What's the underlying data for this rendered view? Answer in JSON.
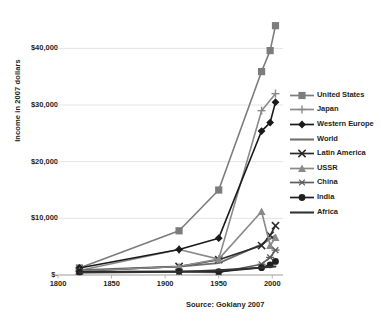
{
  "chart_data": {
    "type": "line",
    "title": "",
    "xlabel": "",
    "ylabel": "Income in 2007 dollars",
    "xlim": [
      1800,
      2010
    ],
    "ylim": [
      0,
      45000
    ],
    "grid": true,
    "legend_position": "right",
    "x_ticks": [
      "1800",
      "1850",
      "1900",
      "1950",
      "2000"
    ],
    "x_tick_values": [
      1800,
      1850,
      1900,
      1950,
      2000
    ],
    "y_ticks": [
      "$-",
      "$10,000",
      "$20,000",
      "$30,000",
      "$40,000"
    ],
    "y_tick_values": [
      0,
      10000,
      20000,
      30000,
      40000
    ],
    "source": "Source: Goklany 2007",
    "series": [
      {
        "name": "United States",
        "color": "#7c7c7c",
        "marker": "square",
        "x": [
          1820,
          1913,
          1950,
          1990,
          1998,
          2003
        ],
        "values": [
          1250,
          7800,
          15000,
          35900,
          39600,
          44000
        ]
      },
      {
        "name": "Japan",
        "color": "#8a8a8a",
        "marker": "plus",
        "x": [
          1820,
          1913,
          1950,
          1990,
          2003
        ],
        "values": [
          800,
          4500,
          2800,
          29000,
          32000
        ]
      },
      {
        "name": "Western Europe",
        "color": "#1a1a1a",
        "marker": "diamond",
        "x": [
          1820,
          1913,
          1950,
          1990,
          1998,
          2003
        ],
        "values": [
          1250,
          4500,
          6500,
          25400,
          26900,
          30500
        ]
      },
      {
        "name": "World",
        "color": "#6f6f6f",
        "marker": "none",
        "x": [
          1820,
          1913,
          1950,
          1990,
          2003
        ],
        "values": [
          850,
          1500,
          2100,
          5400,
          7000
        ]
      },
      {
        "name": "Latin America",
        "color": "#2a2a2a",
        "marker": "cross",
        "x": [
          1820,
          1913,
          1950,
          1990,
          1998,
          2003
        ],
        "values": [
          700,
          1500,
          2700,
          5200,
          7000,
          8700
        ]
      },
      {
        "name": "USSR",
        "color": "#8a8a8a",
        "marker": "triangle",
        "x": [
          1820,
          1913,
          1950,
          1990,
          1998,
          2003
        ],
        "values": [
          700,
          1500,
          2800,
          11200,
          5200,
          6600
        ]
      },
      {
        "name": "China",
        "color": "#5e5e5e",
        "marker": "asterisk",
        "x": [
          1820,
          1913,
          1950,
          1990,
          1998,
          2003
        ],
        "values": [
          600,
          550,
          450,
          1900,
          3100,
          4400
        ]
      },
      {
        "name": "India",
        "color": "#1f1f1f",
        "marker": "circle",
        "x": [
          1820,
          1913,
          1950,
          1990,
          1998,
          2003
        ],
        "values": [
          550,
          650,
          600,
          1300,
          1800,
          2400
        ]
      },
      {
        "name": "Africa",
        "color": "#333333",
        "marker": "none",
        "x": [
          1820,
          1913,
          1950,
          1990,
          2003
        ],
        "values": [
          450,
          550,
          850,
          1300,
          1500
        ]
      }
    ]
  }
}
